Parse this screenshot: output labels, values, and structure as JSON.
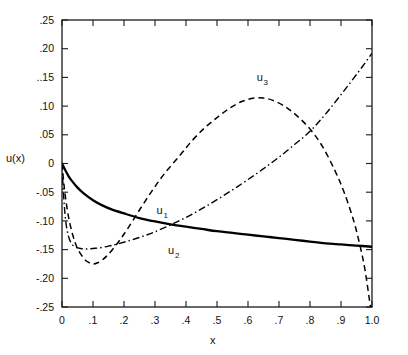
{
  "chart_data": {
    "type": "line",
    "title": "",
    "xlabel": "x",
    "ylabel": "u(x)",
    "xlim": [
      0,
      1.0
    ],
    "ylim": [
      -0.25,
      0.25
    ],
    "grid": false,
    "legend_position": "inline-annotations",
    "x_ticks": [
      0,
      0.1,
      0.2,
      0.3,
      0.4,
      0.5,
      0.6,
      0.7,
      0.8,
      0.9,
      1.0
    ],
    "x_tick_labels": [
      "0",
      ".1",
      ".2",
      ".3",
      ".4",
      ".5",
      ".6",
      ".7",
      ".8",
      ".9",
      "1.0"
    ],
    "y_ticks": [
      0.25,
      0.2,
      0.15,
      0.1,
      0.05,
      0,
      -0.05,
      -0.1,
      -0.15,
      -0.2,
      -0.25
    ],
    "y_tick_labels": [
      ".25",
      ".20",
      "..15",
      ".10",
      ".05",
      "0",
      "-.05",
      "-.10",
      "-.15",
      "-.20",
      "-.25"
    ],
    "series": [
      {
        "name": "u_1",
        "label_base": "u",
        "label_sub": "1",
        "style": "solid",
        "color": "#000000",
        "label_x": 0.315,
        "label_y": -0.088,
        "x": [
          0,
          0.01,
          0.02,
          0.03,
          0.05,
          0.07,
          0.1,
          0.13,
          0.16,
          0.2,
          0.25,
          0.3,
          0.35,
          0.4,
          0.45,
          0.5,
          0.55,
          0.6,
          0.65,
          0.7,
          0.75,
          0.8,
          0.85,
          0.9,
          0.95,
          1.0
        ],
        "y": [
          0.0,
          -0.011,
          -0.021,
          -0.029,
          -0.042,
          -0.052,
          -0.064,
          -0.073,
          -0.08,
          -0.087,
          -0.095,
          -0.101,
          -0.106,
          -0.11,
          -0.114,
          -0.118,
          -0.121,
          -0.124,
          -0.127,
          -0.13,
          -0.133,
          -0.136,
          -0.139,
          -0.141,
          -0.143,
          -0.145
        ]
      },
      {
        "name": "u_2",
        "label_base": "u",
        "label_sub": "2",
        "style": "dashdot",
        "color": "#000000",
        "label_x": 0.352,
        "label_y": -0.158,
        "x": [
          0,
          0.005,
          0.012,
          0.02,
          0.03,
          0.045,
          0.06,
          0.08,
          0.1,
          0.12,
          0.15,
          0.18,
          0.22,
          0.26,
          0.3,
          0.35,
          0.4,
          0.45,
          0.5,
          0.55,
          0.6,
          0.65,
          0.7,
          0.75,
          0.8,
          0.85,
          0.9,
          0.95,
          1.0
        ],
        "y": [
          0.0,
          -0.055,
          -0.1,
          -0.125,
          -0.139,
          -0.146,
          -0.148,
          -0.149,
          -0.148,
          -0.147,
          -0.144,
          -0.14,
          -0.134,
          -0.127,
          -0.119,
          -0.107,
          -0.094,
          -0.079,
          -0.063,
          -0.046,
          -0.028,
          -0.009,
          0.011,
          0.033,
          0.056,
          0.086,
          0.12,
          0.155,
          0.192
        ]
      },
      {
        "name": "u_3",
        "label_base": "u",
        "label_sub": "3",
        "style": "dashed",
        "color": "#000000",
        "label_x": 0.638,
        "label_y": 0.143,
        "x": [
          0,
          0.008,
          0.02,
          0.035,
          0.05,
          0.07,
          0.085,
          0.1,
          0.115,
          0.13,
          0.15,
          0.18,
          0.21,
          0.25,
          0.29,
          0.33,
          0.38,
          0.42,
          0.46,
          0.5,
          0.54,
          0.58,
          0.62,
          0.65,
          0.68,
          0.72,
          0.76,
          0.8,
          0.84,
          0.88,
          0.91,
          0.94,
          0.96,
          0.975,
          0.985,
          0.995
        ],
        "y": [
          0.0,
          -0.045,
          -0.09,
          -0.125,
          -0.148,
          -0.165,
          -0.172,
          -0.175,
          -0.173,
          -0.168,
          -0.158,
          -0.138,
          -0.115,
          -0.081,
          -0.048,
          -0.018,
          0.014,
          0.04,
          0.062,
          0.08,
          0.096,
          0.108,
          0.114,
          0.114,
          0.11,
          0.099,
          0.082,
          0.06,
          0.03,
          -0.012,
          -0.05,
          -0.098,
          -0.14,
          -0.178,
          -0.212,
          -0.25
        ]
      }
    ]
  }
}
